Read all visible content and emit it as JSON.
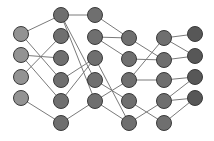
{
  "diagram": {
    "type": "neural-network",
    "width": 214,
    "height": 141,
    "node_radius": 7.5,
    "colors": {
      "input": "#939393",
      "hidden": "#6f6f6f",
      "output": "#575757",
      "edge": "#7a7a7a",
      "stroke": "#3a3a3a"
    },
    "layers": [
      {
        "name": "input",
        "x": 21,
        "ys": [
          34,
          55,
          77,
          98
        ]
      },
      {
        "name": "hidden-1",
        "x": 61,
        "ys": [
          15,
          36,
          58,
          80,
          101,
          123
        ]
      },
      {
        "name": "hidden-2",
        "x": 95,
        "ys": [
          15,
          37,
          58,
          80,
          101
        ]
      },
      {
        "name": "hidden-3",
        "x": 129,
        "ys": [
          38,
          59,
          80,
          101,
          123
        ]
      },
      {
        "name": "hidden-4",
        "x": 164,
        "ys": [
          38,
          60,
          80,
          101,
          123
        ]
      },
      {
        "name": "output",
        "x": 195,
        "ys": [
          34,
          56,
          77,
          98
        ]
      }
    ],
    "edges": [
      [
        [
          0,
          0
        ],
        [
          1,
          0
        ]
      ],
      [
        [
          0,
          0
        ],
        [
          1,
          3
        ]
      ],
      [
        [
          0,
          1
        ],
        [
          1,
          2
        ]
      ],
      [
        [
          0,
          1
        ],
        [
          1,
          4
        ]
      ],
      [
        [
          0,
          2
        ],
        [
          1,
          1
        ]
      ],
      [
        [
          0,
          3
        ],
        [
          1,
          5
        ]
      ],
      [
        [
          1,
          0
        ],
        [
          2,
          0
        ]
      ],
      [
        [
          1,
          0
        ],
        [
          2,
          3
        ]
      ],
      [
        [
          1,
          0
        ],
        [
          2,
          4
        ]
      ],
      [
        [
          1,
          3
        ],
        [
          2,
          2
        ]
      ],
      [
        [
          1,
          4
        ],
        [
          2,
          2
        ]
      ],
      [
        [
          1,
          5
        ],
        [
          2,
          4
        ]
      ],
      [
        [
          2,
          0
        ],
        [
          3,
          0
        ]
      ],
      [
        [
          2,
          1
        ],
        [
          3,
          0
        ]
      ],
      [
        [
          2,
          1
        ],
        [
          3,
          1
        ]
      ],
      [
        [
          2,
          2
        ],
        [
          3,
          4
        ]
      ],
      [
        [
          2,
          3
        ],
        [
          3,
          3
        ]
      ],
      [
        [
          2,
          4
        ],
        [
          3,
          2
        ]
      ],
      [
        [
          2,
          4
        ],
        [
          3,
          4
        ]
      ],
      [
        [
          3,
          0
        ],
        [
          4,
          1
        ]
      ],
      [
        [
          3,
          1
        ],
        [
          4,
          1
        ]
      ],
      [
        [
          3,
          2
        ],
        [
          4,
          0
        ]
      ],
      [
        [
          3,
          2
        ],
        [
          4,
          2
        ]
      ],
      [
        [
          3,
          3
        ],
        [
          4,
          4
        ]
      ],
      [
        [
          3,
          4
        ],
        [
          4,
          3
        ]
      ],
      [
        [
          4,
          0
        ],
        [
          5,
          0
        ]
      ],
      [
        [
          4,
          0
        ],
        [
          5,
          1
        ]
      ],
      [
        [
          4,
          1
        ],
        [
          5,
          1
        ]
      ],
      [
        [
          4,
          2
        ],
        [
          5,
          2
        ]
      ],
      [
        [
          4,
          3
        ],
        [
          5,
          2
        ]
      ],
      [
        [
          4,
          3
        ],
        [
          5,
          3
        ]
      ],
      [
        [
          4,
          4
        ],
        [
          5,
          3
        ]
      ]
    ]
  }
}
